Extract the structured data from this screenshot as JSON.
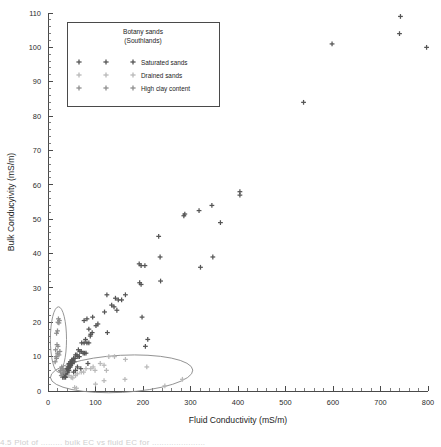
{
  "figure": {
    "background": "#ffffff",
    "caption_partial": "4.5  Plot of ......... bulk EC vs fluid EC for ......................"
  },
  "legend": {
    "title_line1": "Botany sands",
    "title_line2": "(Southlands)",
    "entries": [
      {
        "label": "Saturated sands",
        "color": "#555555"
      },
      {
        "label": "Drained sands",
        "color": "#b9b9b9"
      },
      {
        "label": "High clay content",
        "color": "#8e8e8e"
      }
    ]
  },
  "chart_data": {
    "type": "scatter",
    "title": "",
    "xlabel": "Fluid Conductivity (mS/m)",
    "ylabel": "Bulk Conducyivity (mS/m)",
    "xlim": [
      0,
      800
    ],
    "ylim": [
      0,
      110
    ],
    "xticks": [
      0,
      100,
      200,
      300,
      400,
      500,
      600,
      700,
      800
    ],
    "yticks": [
      0,
      10,
      20,
      30,
      40,
      50,
      60,
      70,
      80,
      90,
      100,
      110
    ],
    "xminor_step": 20,
    "yminor_step": 2,
    "grid": false,
    "legend_position": "upper-left",
    "marker": "plus",
    "annotations": [
      {
        "name": "high-clay-ellipse",
        "shape": "ellipse",
        "cx": 22,
        "cy": 15,
        "rx": 17,
        "ry": 9.5,
        "rotation": 0
      },
      {
        "name": "drained-sands-ellipse",
        "shape": "ellipse",
        "cx": 155,
        "cy": 5.0,
        "rx": 150,
        "ry": 5.4,
        "rotation": -3
      }
    ],
    "series": [
      {
        "name": "Saturated sands",
        "color": "#555555",
        "points": [
          [
            742,
            109
          ],
          [
            740,
            104
          ],
          [
            598,
            101
          ],
          [
            797,
            100
          ],
          [
            538,
            84
          ],
          [
            404,
            58
          ],
          [
            404,
            57
          ],
          [
            288,
            51.5
          ],
          [
            286,
            51
          ],
          [
            318,
            52.5
          ],
          [
            345,
            54
          ],
          [
            363,
            49
          ],
          [
            233,
            45
          ],
          [
            236,
            39
          ],
          [
            347,
            39
          ],
          [
            321,
            36
          ],
          [
            192,
            37
          ],
          [
            196,
            36.5
          ],
          [
            204,
            36.5
          ],
          [
            237,
            32
          ],
          [
            193,
            31.5
          ],
          [
            196,
            31
          ],
          [
            124,
            28
          ],
          [
            163,
            28
          ],
          [
            142,
            27
          ],
          [
            148,
            26.5
          ],
          [
            155,
            26.5
          ],
          [
            134,
            25
          ],
          [
            139,
            24.5
          ],
          [
            145,
            23.5
          ],
          [
            119,
            23
          ],
          [
            198,
            21.5
          ],
          [
            82,
            21
          ],
          [
            94,
            21.5
          ],
          [
            76,
            20.5
          ],
          [
            105,
            19.5
          ],
          [
            101,
            19
          ],
          [
            86,
            18
          ],
          [
            93,
            17
          ],
          [
            125,
            17
          ],
          [
            90,
            16.5
          ],
          [
            89,
            16
          ],
          [
            79,
            15
          ],
          [
            210,
            15
          ],
          [
            205,
            13
          ],
          [
            71,
            14
          ],
          [
            76,
            14
          ],
          [
            82,
            14
          ],
          [
            86,
            14
          ],
          [
            64,
            12
          ],
          [
            67,
            11.5
          ],
          [
            70,
            11.5
          ],
          [
            74,
            11
          ],
          [
            77,
            11
          ],
          [
            80,
            11
          ],
          [
            58,
            10.5
          ],
          [
            61,
            10.5
          ],
          [
            63,
            10
          ],
          [
            66,
            10
          ],
          [
            54,
            9.5
          ],
          [
            57,
            9.5
          ],
          [
            50,
            9
          ],
          [
            52,
            9
          ],
          [
            55,
            8.5
          ],
          [
            47,
            8.5
          ],
          [
            49,
            8
          ],
          [
            51,
            8
          ],
          [
            44,
            8
          ],
          [
            46,
            7.5
          ],
          [
            48,
            7.5
          ],
          [
            42,
            7
          ],
          [
            45,
            7
          ],
          [
            47,
            7
          ],
          [
            40,
            6.5
          ],
          [
            43,
            6.5
          ],
          [
            38,
            6
          ],
          [
            41,
            6
          ],
          [
            44,
            6
          ],
          [
            36,
            5.5
          ],
          [
            39,
            5.5
          ],
          [
            42,
            5.5
          ],
          [
            35,
            5
          ],
          [
            38,
            5
          ],
          [
            40,
            5
          ],
          [
            33,
            4.5
          ],
          [
            36,
            4.5
          ],
          [
            39,
            4.5
          ],
          [
            34,
            4
          ],
          [
            37,
            4
          ],
          [
            31,
            4
          ],
          [
            69,
            6.5
          ],
          [
            84,
            8
          ],
          [
            54,
            5.5
          ],
          [
            58,
            6
          ],
          [
            62,
            7
          ]
        ]
      },
      {
        "name": "Drained sands",
        "color": "#b9b9b9",
        "points": [
          [
            128,
            10
          ],
          [
            140,
            10
          ],
          [
            163,
            9.2
          ],
          [
            110,
            8
          ],
          [
            118,
            7.5
          ],
          [
            95,
            7
          ],
          [
            208,
            7
          ],
          [
            123,
            6
          ],
          [
            99,
            6
          ],
          [
            90,
            6.5
          ],
          [
            62,
            5
          ],
          [
            58,
            4.5
          ],
          [
            70,
            5.5
          ],
          [
            283,
            3.4
          ],
          [
            162,
            3.4
          ],
          [
            118,
            3
          ],
          [
            100,
            2
          ],
          [
            246,
            1.5
          ],
          [
            56,
            1
          ],
          [
            60,
            0.8
          ],
          [
            80,
            6.5
          ],
          [
            75,
            5.5
          ],
          [
            49,
            4
          ],
          [
            52,
            3.8
          ],
          [
            44,
            4.5
          ]
        ]
      },
      {
        "name": "High clay content",
        "color": "#8e8e8e",
        "points": [
          [
            22,
            21
          ],
          [
            24,
            20.5
          ],
          [
            21,
            20
          ],
          [
            23,
            19.8
          ],
          [
            20,
            17.5
          ],
          [
            18,
            16.8
          ],
          [
            19,
            13.5
          ],
          [
            21,
            13
          ],
          [
            16,
            12
          ],
          [
            20,
            11
          ],
          [
            23,
            10.5
          ],
          [
            18,
            9.5
          ],
          [
            15,
            8.5
          ],
          [
            25,
            11.5
          ],
          [
            17,
            10
          ],
          [
            29,
            7
          ],
          [
            31,
            6.5
          ],
          [
            33,
            6
          ],
          [
            27,
            5.5
          ],
          [
            30,
            5
          ],
          [
            35,
            5.5
          ],
          [
            26,
            6
          ],
          [
            28,
            4.5
          ]
        ]
      }
    ]
  }
}
